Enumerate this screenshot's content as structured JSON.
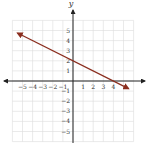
{
  "chart_data": {
    "type": "line",
    "title": "",
    "xlabel": "x",
    "ylabel": "y",
    "xlim": [
      -6,
      6
    ],
    "ylim": [
      -6,
      6
    ],
    "grid": true,
    "x_ticks": [
      "−5",
      "−4",
      "−3",
      "−2",
      "−1",
      "1",
      "2",
      "3",
      "4"
    ],
    "y_ticks": [
      "5",
      "4",
      "3",
      "2",
      "1",
      "−1",
      "−2",
      "−3",
      "−4",
      "−5"
    ],
    "series": [
      {
        "name": "line",
        "equation": "y = -0.5x + 2",
        "slope": -0.5,
        "intercept": 2,
        "x": [
          -5.5,
          5.5
        ],
        "y": [
          4.75,
          -0.75
        ],
        "color": "#8b2e1f",
        "arrows": "both"
      }
    ]
  },
  "colors": {
    "grid": "#dcdcdc",
    "axis": "#222222",
    "line": "#8b2e1f"
  }
}
